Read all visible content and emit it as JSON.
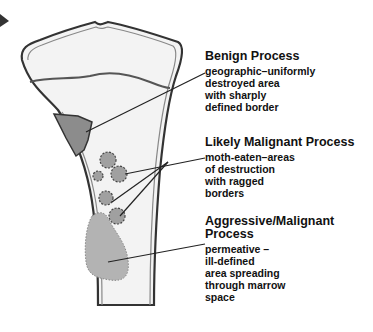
{
  "diagram": {
    "labels": [
      {
        "title": "Benign Process",
        "description": [
          "geographic–uniformly",
          "destroyed area",
          "with sharply",
          "defined border"
        ]
      },
      {
        "title": "Likely Malignant Process",
        "description": [
          "moth-eaten–areas",
          "of destruction",
          "with ragged",
          "borders"
        ]
      },
      {
        "title_lines": [
          "Aggressive/Malignant",
          "Process"
        ],
        "description": [
          "permeative –",
          "ill-defined",
          "area spreading",
          "through marrow",
          "space"
        ]
      }
    ],
    "colors": {
      "outline": "#333333",
      "bone_fill": "#f2f2f2",
      "benign_lesion": "#8c8c8c",
      "moth_eaten": "#9a9a9a",
      "permeative": "#a8a8a8"
    }
  }
}
